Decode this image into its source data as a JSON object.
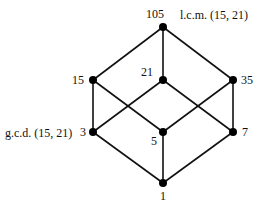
{
  "diagram": {
    "type": "hasse-diagram",
    "colors": {
      "line": "#111111",
      "node": "#000000",
      "background": "#ffffff"
    },
    "nodes": [
      {
        "id": "n105",
        "label": "105",
        "x": 163,
        "y": 27,
        "lx": 155,
        "ly": 18,
        "anchor": "middle"
      },
      {
        "id": "n15",
        "label": "15",
        "x": 93,
        "y": 80,
        "lx": 84,
        "ly": 84,
        "anchor": "end"
      },
      {
        "id": "n21",
        "label": "21",
        "x": 163,
        "y": 80,
        "lx": 153,
        "ly": 76,
        "anchor": "end"
      },
      {
        "id": "n35",
        "label": "35",
        "x": 233,
        "y": 80,
        "lx": 241,
        "ly": 84,
        "anchor": "start"
      },
      {
        "id": "n3",
        "label": "3",
        "x": 93,
        "y": 132,
        "lx": 86,
        "ly": 136,
        "anchor": "end"
      },
      {
        "id": "n5",
        "label": "5",
        "x": 163,
        "y": 132,
        "lx": 154,
        "ly": 145,
        "anchor": "middle"
      },
      {
        "id": "n7",
        "label": "7",
        "x": 233,
        "y": 132,
        "lx": 242,
        "ly": 136,
        "anchor": "start"
      },
      {
        "id": "n1",
        "label": "1",
        "x": 163,
        "y": 183,
        "lx": 163,
        "ly": 200,
        "anchor": "middle"
      }
    ],
    "edges": [
      [
        "n105",
        "n15"
      ],
      [
        "n105",
        "n21"
      ],
      [
        "n105",
        "n35"
      ],
      [
        "n15",
        "n3"
      ],
      [
        "n15",
        "n5"
      ],
      [
        "n21",
        "n3"
      ],
      [
        "n21",
        "n7"
      ],
      [
        "n35",
        "n5"
      ],
      [
        "n35",
        "n7"
      ],
      [
        "n3",
        "n1"
      ],
      [
        "n5",
        "n1"
      ],
      [
        "n7",
        "n1"
      ]
    ],
    "annotations": {
      "lcm": "l.c.m. (15, 21)",
      "gcd": "g.c.d. (15, 21)"
    }
  }
}
